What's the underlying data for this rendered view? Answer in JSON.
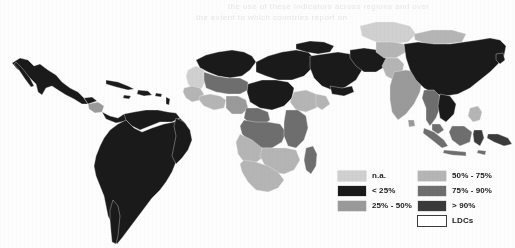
{
  "figure": {
    "type": "choropleth-world-map",
    "projection": "equirectangular-cropped",
    "regions_shown": "Latin America, Africa, Middle East, Asia, Southeast Asia, Oceania",
    "background_color": "#ffffff"
  },
  "legend": {
    "name": "map-legend",
    "columns": [
      {
        "entries": [
          {
            "label": "n.a.",
            "color": "#d0d0d0",
            "outlined": false
          },
          {
            "label": "< 25%",
            "color": "#1a1a1a",
            "outlined": false
          },
          {
            "label": "25% - 50%",
            "color": "#9a9a9a",
            "outlined": false
          }
        ]
      },
      {
        "entries": [
          {
            "label": "50% - 75%",
            "color": "#b5b5b5",
            "outlined": false
          },
          {
            "label": "75% - 90%",
            "color": "#6e6e6e",
            "outlined": false
          },
          {
            "label": "> 90%",
            "color": "#3a3a3a",
            "outlined": false
          },
          {
            "label": "LDCs",
            "color": "#ffffff",
            "outlined": true
          }
        ]
      }
    ]
  },
  "chart_data": {
    "type": "heatmap",
    "title": "",
    "xlabel": "",
    "ylabel": "",
    "legend_position": "bottom-right",
    "grid": false,
    "classes": [
      "n.a.",
      "< 25%",
      "25% - 50%",
      "50% - 75%",
      "75% - 90%",
      "> 90%",
      "LDCs"
    ],
    "class_colors": [
      "#d0d0d0",
      "#1a1a1a",
      "#9a9a9a",
      "#b5b5b5",
      "#6e6e6e",
      "#3a3a3a",
      "#ffffff"
    ],
    "regions": [
      {
        "name": "Mexico",
        "class": "< 25%",
        "color": "#1a1a1a"
      },
      {
        "name": "Guatemala",
        "class": "< 25%",
        "color": "#1a1a1a"
      },
      {
        "name": "Honduras",
        "class": "25% - 50%",
        "color": "#9a9a9a"
      },
      {
        "name": "Nicaragua",
        "class": "25% - 50%",
        "color": "#9a9a9a"
      },
      {
        "name": "Costa Rica / Panama",
        "class": "< 25%",
        "color": "#1a1a1a"
      },
      {
        "name": "Cuba / Caribbean",
        "class": "< 25%",
        "color": "#1a1a1a"
      },
      {
        "name": "Colombia",
        "class": "< 25%",
        "color": "#1a1a1a"
      },
      {
        "name": "Venezuela",
        "class": "< 25%",
        "color": "#1a1a1a"
      },
      {
        "name": "Brazil",
        "class": "< 25%",
        "color": "#1a1a1a"
      },
      {
        "name": "Peru / Bolivia",
        "class": "< 25%",
        "color": "#1a1a1a"
      },
      {
        "name": "Argentina / Chile",
        "class": "< 25%",
        "color": "#1a1a1a"
      },
      {
        "name": "Morocco / Algeria",
        "class": "< 25%",
        "color": "#1a1a1a"
      },
      {
        "name": "Libya / Egypt",
        "class": "< 25%",
        "color": "#1a1a1a"
      },
      {
        "name": "Mauritania",
        "class": "n.a.",
        "color": "#d0d0d0"
      },
      {
        "name": "Mali / Niger",
        "class": "75% - 90%",
        "color": "#6e6e6e"
      },
      {
        "name": "Senegal / Guinea",
        "class": "50% - 75%",
        "color": "#b5b5b5"
      },
      {
        "name": "Nigeria",
        "class": "25% - 50%",
        "color": "#9a9a9a"
      },
      {
        "name": "Chad / Sudan",
        "class": "< 25%",
        "color": "#1a1a1a"
      },
      {
        "name": "Ethiopia",
        "class": "50% - 75%",
        "color": "#b5b5b5"
      },
      {
        "name": "DR Congo",
        "class": "75% - 90%",
        "color": "#6e6e6e"
      },
      {
        "name": "Angola / Zambia",
        "class": "50% - 75%",
        "color": "#b5b5b5"
      },
      {
        "name": "Tanzania / Kenya",
        "class": "75% - 90%",
        "color": "#6e6e6e"
      },
      {
        "name": "Madagascar",
        "class": "75% - 90%",
        "color": "#6e6e6e"
      },
      {
        "name": "South Africa",
        "class": "50% - 75%",
        "color": "#b5b5b5"
      },
      {
        "name": "Saudi Arabia / Gulf",
        "class": "< 25%",
        "color": "#1a1a1a"
      },
      {
        "name": "Iran / Iraq",
        "class": "< 25%",
        "color": "#1a1a1a"
      },
      {
        "name": "Turkey",
        "class": "< 25%",
        "color": "#1a1a1a"
      },
      {
        "name": "Kazakhstan",
        "class": "n.a.",
        "color": "#d0d0d0"
      },
      {
        "name": "Central Asia",
        "class": "50% - 75%",
        "color": "#b5b5b5"
      },
      {
        "name": "Mongolia",
        "class": "50% - 75%",
        "color": "#b5b5b5"
      },
      {
        "name": "China",
        "class": "< 25%",
        "color": "#1a1a1a"
      },
      {
        "name": "India",
        "class": "25% - 50%",
        "color": "#9a9a9a"
      },
      {
        "name": "Pakistan",
        "class": "50% - 75%",
        "color": "#b5b5b5"
      },
      {
        "name": "Myanmar / Thailand",
        "class": "75% - 90%",
        "color": "#6e6e6e"
      },
      {
        "name": "Vietnam / Laos",
        "class": "< 25%",
        "color": "#1a1a1a"
      },
      {
        "name": "Indonesia",
        "class": "75% - 90%",
        "color": "#6e6e6e"
      },
      {
        "name": "Philippines",
        "class": "50% - 75%",
        "color": "#b5b5b5"
      },
      {
        "name": "Papua New Guinea",
        "class": "> 90%",
        "color": "#3a3a3a"
      }
    ]
  },
  "bleedthrough": {
    "line1": "the use of these indicators across regions and over",
    "line2": "the extent to which countries report on"
  }
}
